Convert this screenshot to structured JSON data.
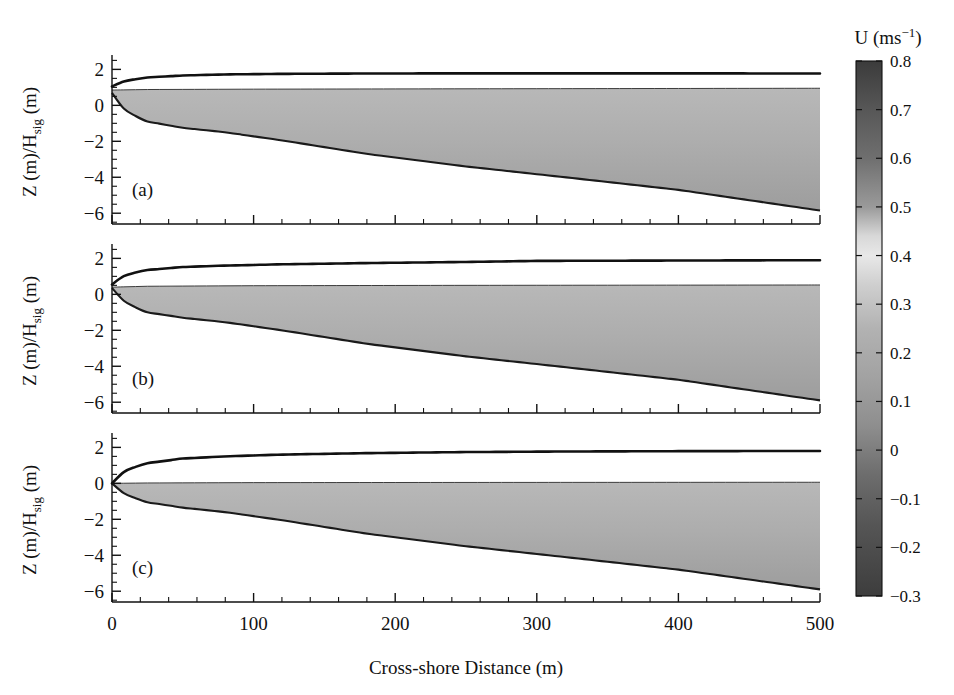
{
  "figure": {
    "type": "multi-panel-contour-quiver",
    "background": "#ffffff",
    "width": 954,
    "height": 695
  },
  "axes": {
    "x": {
      "label": "Cross-shore Distance (m)",
      "ticks": [
        0,
        100,
        200,
        300,
        400,
        500
      ],
      "tick_labels": [
        "0",
        "100",
        "200",
        "300",
        "400",
        "500"
      ],
      "min": 0,
      "max": 500,
      "minor_tick_step": 20
    },
    "y": {
      "label_main": "Z (m)/H",
      "label_sub": "sig",
      "label_tail": " (m)",
      "label_full": "Z (m)/H_sig (m)",
      "ticks": [
        2,
        0,
        -2,
        -4,
        -6
      ],
      "tick_labels": [
        "2",
        "0",
        "−2",
        "−4",
        "−6"
      ],
      "min": -6.6,
      "max": 2.8,
      "minor_tick_step": 0.5
    }
  },
  "panels": [
    {
      "id": "a",
      "label": "(a)",
      "surface_start_z": 1.05,
      "surface_end_z": 1.75,
      "bed_start_z": 0.7,
      "bed_end_z": -5.85,
      "description": "Uppermost panel, undertow cell with dark negative patch near shoreline and bright high-velocity core near x=60 m"
    },
    {
      "id": "b",
      "label": "(b)",
      "surface_start_z": 0.55,
      "surface_end_z": 1.9,
      "bed_start_z": 0.35,
      "bed_end_z": -5.9,
      "description": "Middle panel, bright high-velocity core near x=65 m, weak dark band near x=170 m"
    },
    {
      "id": "c",
      "label": "(c)",
      "surface_start_z": 0.0,
      "surface_end_z": 1.8,
      "bed_start_z": 0.0,
      "bed_end_z": -5.9,
      "description": "Lowest panel, apex exactly at origin, bright core near x=55 m"
    }
  ],
  "colorbar": {
    "title_main": "U (ms",
    "title_sup": "−1",
    "title_tail": ")",
    "title_full": "U (ms⁻¹)",
    "vmin": -0.3,
    "vmax": 0.8,
    "ticks": [
      0.8,
      0.7,
      0.6,
      0.5,
      0.4,
      0.3,
      0.2,
      0.1,
      0,
      -0.1,
      -0.2,
      -0.3
    ],
    "tick_labels": [
      "0.8",
      "0.7",
      "0.6",
      "0.5",
      "0.4",
      "0.3",
      "0.2",
      "0.1",
      "0",
      "−0.1",
      "−0.2",
      "−0.3"
    ],
    "colormap": "gray-diverging",
    "stops": [
      {
        "value": 0.8,
        "color": "#3b3b3b"
      },
      {
        "value": 0.7,
        "color": "#575757"
      },
      {
        "value": 0.6,
        "color": "#6f6f6f"
      },
      {
        "value": 0.5,
        "color": "#9a9a9a"
      },
      {
        "value": 0.44,
        "color": "#d8d8d8"
      },
      {
        "value": 0.4,
        "color": "#e8e8e8"
      },
      {
        "value": 0.34,
        "color": "#cfcfcf"
      },
      {
        "value": 0.25,
        "color": "#b2b2b2"
      },
      {
        "value": 0.15,
        "color": "#a2a2a2"
      },
      {
        "value": 0.05,
        "color": "#8e8e8e"
      },
      {
        "value": -0.05,
        "color": "#6d6d6d"
      },
      {
        "value": -0.15,
        "color": "#565656"
      },
      {
        "value": -0.3,
        "color": "#3d3d3d"
      }
    ]
  },
  "quiver": {
    "arrow_color": "#2b2b2b",
    "direction": "onshore-to-offshore (rightward)",
    "column_spacing_m": 23,
    "rows_per_column": 4
  },
  "chart_data": {
    "type": "heatmap",
    "title": "",
    "xlabel": "Cross-shore Distance (m)",
    "ylabel": "Z (m)/H_sig (m)",
    "xlim": [
      0,
      500
    ],
    "ylim": [
      -6.6,
      2.8
    ],
    "colorbar_label": "U (ms⁻¹)",
    "colorbar_range": [
      -0.3,
      0.8
    ],
    "colorbar_ticks": [
      -0.3,
      -0.2,
      -0.1,
      0,
      0.1,
      0.2,
      0.3,
      0.4,
      0.5,
      0.6,
      0.7,
      0.8
    ],
    "grid": false,
    "legend": "colorbar-right",
    "panels": [
      {
        "label": "(a)",
        "series": [
          {
            "name": "surface-envelope",
            "x": [
              0,
              10,
              25,
              50,
              80,
              120,
              180,
              250,
              320,
              400,
              500
            ],
            "y": [
              1.05,
              1.38,
              1.55,
              1.66,
              1.72,
              1.75,
              1.77,
              1.78,
              1.78,
              1.78,
              1.77
            ]
          },
          {
            "name": "bed-profile",
            "x": [
              0,
              10,
              25,
              50,
              80,
              120,
              180,
              250,
              320,
              400,
              500
            ],
            "y": [
              0.7,
              -0.35,
              -0.9,
              -1.25,
              -1.5,
              -1.95,
              -2.7,
              -3.4,
              -4.0,
              -4.7,
              -5.85
            ]
          },
          {
            "name": "mean-water-level",
            "x": [
              0,
              25,
              100,
              250,
              500
            ],
            "y": [
              0.85,
              0.88,
              0.9,
              0.92,
              0.95
            ]
          }
        ],
        "velocity_features": [
          {
            "kind": "negative-core",
            "x_m": 12,
            "z": 0.55,
            "value": -0.25
          },
          {
            "kind": "positive-core",
            "x_m": 62,
            "z": -0.45,
            "value": 0.55
          },
          {
            "kind": "dark-patch",
            "x_m": 450,
            "z": 0.2,
            "value": 0.62
          }
        ]
      },
      {
        "label": "(b)",
        "series": [
          {
            "name": "surface-envelope",
            "x": [
              0,
              10,
              25,
              50,
              80,
              120,
              180,
              250,
              300,
              400,
              500
            ],
            "y": [
              0.55,
              1.1,
              1.35,
              1.52,
              1.6,
              1.67,
              1.74,
              1.8,
              1.86,
              1.88,
              1.9
            ]
          },
          {
            "name": "bed-profile",
            "x": [
              0,
              10,
              25,
              50,
              80,
              120,
              180,
              250,
              320,
              400,
              500
            ],
            "y": [
              0.35,
              -0.5,
              -1.0,
              -1.3,
              -1.55,
              -2.0,
              -2.75,
              -3.45,
              -4.05,
              -4.75,
              -5.9
            ]
          },
          {
            "name": "mean-water-level",
            "x": [
              0,
              25,
              100,
              250,
              500
            ],
            "y": [
              0.4,
              0.45,
              0.48,
              0.5,
              0.52
            ]
          }
        ],
        "velocity_features": [
          {
            "kind": "positive-core",
            "x_m": 63,
            "z": -0.7,
            "value": 0.58
          },
          {
            "kind": "dark-band",
            "x_m": 170,
            "z": -0.35,
            "value": 0.1
          },
          {
            "kind": "dark-patch",
            "x_m": 460,
            "z": -0.2,
            "value": 0.6
          }
        ]
      },
      {
        "label": "(c)",
        "series": [
          {
            "name": "surface-envelope",
            "x": [
              0,
              10,
              25,
              50,
              80,
              120,
              180,
              250,
              320,
              400,
              500
            ],
            "y": [
              0.0,
              0.75,
              1.12,
              1.38,
              1.5,
              1.6,
              1.68,
              1.74,
              1.77,
              1.79,
              1.8
            ]
          },
          {
            "name": "bed-profile",
            "x": [
              0,
              10,
              25,
              50,
              80,
              120,
              180,
              250,
              320,
              400,
              500
            ],
            "y": [
              0.0,
              -0.65,
              -1.05,
              -1.35,
              -1.6,
              -2.05,
              -2.8,
              -3.5,
              -4.1,
              -4.8,
              -5.9
            ]
          },
          {
            "name": "mean-water-level",
            "x": [
              0,
              25,
              100,
              250,
              500
            ],
            "y": [
              0.0,
              0.02,
              0.04,
              0.05,
              0.06
            ]
          }
        ],
        "velocity_features": [
          {
            "kind": "positive-core",
            "x_m": 55,
            "z": -1.15,
            "value": 0.55
          },
          {
            "kind": "dark-patch",
            "x_m": 470,
            "z": -1.2,
            "value": 0.6
          }
        ]
      }
    ]
  }
}
